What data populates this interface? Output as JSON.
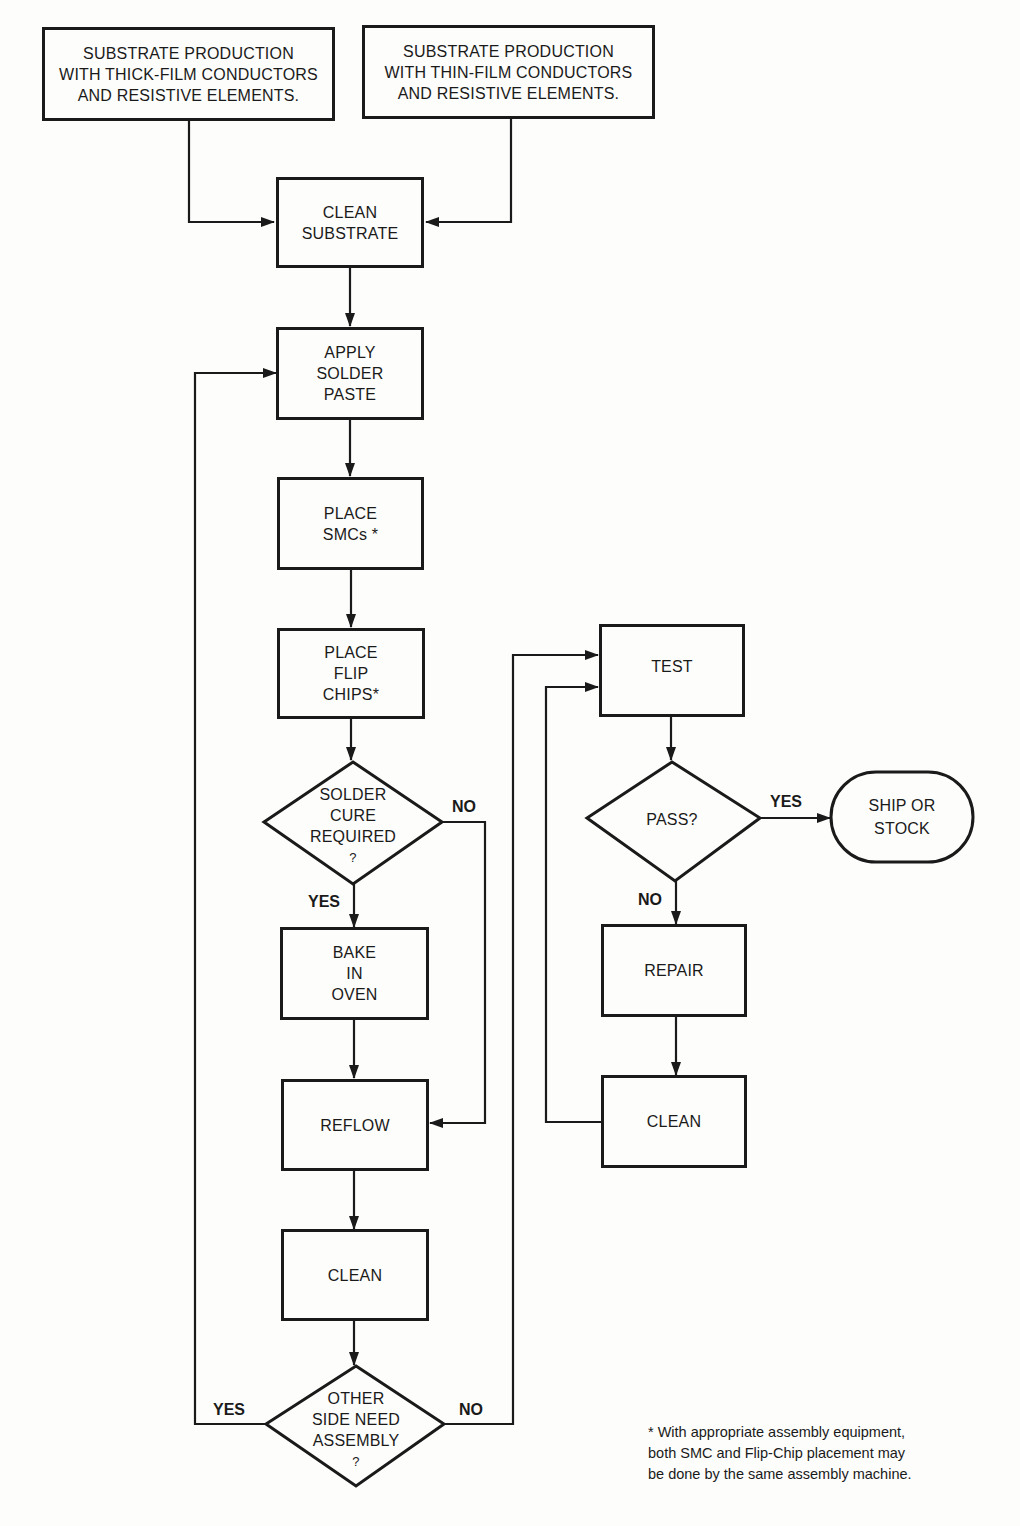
{
  "diagram": {
    "type": "flowchart",
    "nodes": {
      "thick_film": {
        "lines": [
          "SUBSTRATE PRODUCTION",
          "WITH THICK-FILM CONDUCTORS",
          "AND RESISTIVE ELEMENTS."
        ]
      },
      "thin_film": {
        "lines": [
          "SUBSTRATE PRODUCTION",
          "WITH THIN-FILM CONDUCTORS",
          "AND RESISTIVE ELEMENTS."
        ]
      },
      "clean_substrate": {
        "lines": [
          "CLEAN",
          "SUBSTRATE"
        ]
      },
      "apply_paste": {
        "lines": [
          "APPLY",
          "SOLDER",
          "PASTE"
        ]
      },
      "place_smcs": {
        "lines": [
          "PLACE",
          "SMCs *"
        ]
      },
      "place_flip": {
        "lines": [
          "PLACE",
          "FLIP",
          "CHIPS*"
        ]
      },
      "solder_cure": {
        "lines": [
          "SOLDER",
          "CURE",
          "REQUIRED",
          "?"
        ]
      },
      "bake": {
        "lines": [
          "BAKE",
          "IN",
          "OVEN"
        ]
      },
      "reflow": {
        "lines": [
          "REFLOW"
        ]
      },
      "clean1": {
        "lines": [
          "CLEAN"
        ]
      },
      "other_side": {
        "lines": [
          "OTHER",
          "SIDE NEED",
          "ASSEMBLY",
          "?"
        ]
      },
      "test": {
        "lines": [
          "TEST"
        ]
      },
      "pass": {
        "lines": [
          "PASS?"
        ]
      },
      "ship": {
        "lines": [
          "SHIP OR",
          "STOCK"
        ]
      },
      "repair": {
        "lines": [
          "REPAIR"
        ]
      },
      "clean2": {
        "lines": [
          "CLEAN"
        ]
      }
    },
    "labels": {
      "cure_no": "NO",
      "cure_yes": "YES",
      "other_yes": "YES",
      "other_no": "NO",
      "pass_yes": "YES",
      "pass_no": "NO"
    },
    "footnote": [
      "* With appropriate assembly equipment,",
      "both SMC and Flip-Chip placement may",
      "be done by the same assembly machine."
    ]
  }
}
